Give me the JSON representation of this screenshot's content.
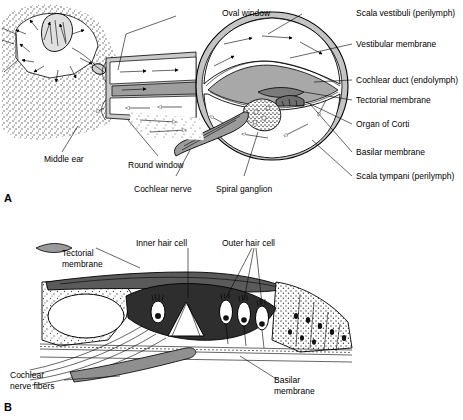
{
  "figure": {
    "panels": [
      {
        "letter": "A",
        "name": "cochlea-cross-section",
        "labels": [
          {
            "id": "oval-window",
            "text": "Oval window"
          },
          {
            "id": "middle-ear",
            "text": "Middle ear"
          },
          {
            "id": "round-window",
            "text": "Round window"
          },
          {
            "id": "cochlear-nerve",
            "text": "Cochlear nerve"
          },
          {
            "id": "spiral-ganglion",
            "text": "Spiral ganglion"
          },
          {
            "id": "scala-vestibuli",
            "text": "Scala vestibuli (perilymph)"
          },
          {
            "id": "vestibular-membrane",
            "text": "Vestibular membrane"
          },
          {
            "id": "cochlear-duct",
            "text": "Cochlear duct (endolymph)"
          },
          {
            "id": "tectorial-membrane",
            "text": "Tectorial membrane"
          },
          {
            "id": "organ-of-corti",
            "text": "Organ of Corti"
          },
          {
            "id": "basilar-membrane",
            "text": "Basilar membrane"
          },
          {
            "id": "scala-tympani",
            "text": "Scala tympani (perilymph)"
          }
        ]
      },
      {
        "letter": "B",
        "name": "organ-of-corti-detail",
        "labels": [
          {
            "id": "tectorial-membrane-b-line1",
            "text": "Tectorial"
          },
          {
            "id": "tectorial-membrane-b-line2",
            "text": "membrane"
          },
          {
            "id": "inner-hair-cell",
            "text": "Inner hair cell"
          },
          {
            "id": "outer-hair-cell",
            "text": "Outer hair cell"
          },
          {
            "id": "cochlear-nerve-fibers-line1",
            "text": "Cochlear"
          },
          {
            "id": "cochlear-nerve-fibers-line2",
            "text": "nerve fibers"
          },
          {
            "id": "basilar-membrane-b-line1",
            "text": "Basilar"
          },
          {
            "id": "basilar-membrane-b-line2",
            "text": "membrane"
          }
        ]
      }
    ]
  },
  "colors": {
    "ink": "#000000",
    "background": "#ffffff",
    "tissue_light": "#d9d9d9",
    "tissue_mid": "#b5b5b5",
    "tissue_dark": "#8a8a8a",
    "fluid": "#f2f2f2"
  }
}
